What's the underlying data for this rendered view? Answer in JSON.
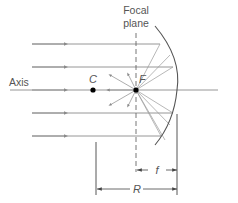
{
  "labels": {
    "focal_plane_line1": "Focal",
    "focal_plane_line2": "plane",
    "axis": "Axis",
    "center_of_curvature": "C",
    "focal_point": "F",
    "focal_length": "f",
    "radius": "R"
  },
  "colors": {
    "line": "#8a8a8a",
    "dark_line": "#555555",
    "point": "#000000",
    "text": "#555555"
  },
  "geometry": {
    "axis_y": 90,
    "incoming_ray_ys": [
      44,
      67,
      90,
      113,
      136
    ],
    "focal_plane_x": 136,
    "center_x": 93,
    "mirror_vertex_x": 177
  }
}
